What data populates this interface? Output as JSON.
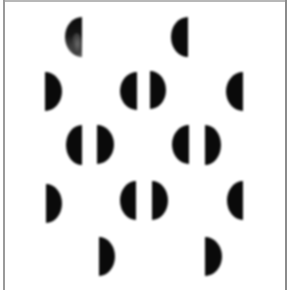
{
  "figure": {
    "background_color": "#ffffff",
    "shape_color": "#0a0a0a",
    "frame_color": "#9a9a9a"
  },
  "shapes": [
    {
      "id": 1,
      "x": 65,
      "y": 17,
      "w": 17,
      "h": 40,
      "flat": "right",
      "texture": "mottled"
    },
    {
      "id": 2,
      "x": 171,
      "y": 17,
      "w": 17,
      "h": 40,
      "flat": "right",
      "texture": "solid"
    },
    {
      "id": 3,
      "x": 45,
      "y": 72,
      "w": 17,
      "h": 39,
      "flat": "left",
      "texture": "solid"
    },
    {
      "id": 4,
      "x": 120,
      "y": 72,
      "w": 17,
      "h": 38,
      "flat": "right",
      "texture": "solid"
    },
    {
      "id": 5,
      "x": 150,
      "y": 71,
      "w": 16,
      "h": 38,
      "flat": "left",
      "texture": "solid"
    },
    {
      "id": 6,
      "x": 226,
      "y": 72,
      "w": 17,
      "h": 39,
      "flat": "right",
      "texture": "solid"
    },
    {
      "id": 7,
      "x": 66,
      "y": 125,
      "w": 16,
      "h": 40,
      "flat": "right",
      "texture": "solid"
    },
    {
      "id": 8,
      "x": 97,
      "y": 125,
      "w": 17,
      "h": 39,
      "flat": "left",
      "texture": "solid"
    },
    {
      "id": 9,
      "x": 172,
      "y": 125,
      "w": 17,
      "h": 39,
      "flat": "right",
      "texture": "solid"
    },
    {
      "id": 10,
      "x": 205,
      "y": 125,
      "w": 16,
      "h": 40,
      "flat": "left",
      "texture": "solid"
    },
    {
      "id": 11,
      "x": 46,
      "y": 184,
      "w": 16,
      "h": 39,
      "flat": "left",
      "texture": "solid"
    },
    {
      "id": 12,
      "x": 120,
      "y": 181,
      "w": 16,
      "h": 39,
      "flat": "right",
      "texture": "solid"
    },
    {
      "id": 13,
      "x": 152,
      "y": 181,
      "w": 16,
      "h": 39,
      "flat": "left",
      "texture": "solid"
    },
    {
      "id": 14,
      "x": 227,
      "y": 181,
      "w": 16,
      "h": 39,
      "flat": "right",
      "texture": "solid"
    },
    {
      "id": 15,
      "x": 99,
      "y": 237,
      "w": 16,
      "h": 39,
      "flat": "left",
      "texture": "solid"
    },
    {
      "id": 16,
      "x": 205,
      "y": 237,
      "w": 17,
      "h": 39,
      "flat": "left",
      "texture": "solid"
    }
  ]
}
